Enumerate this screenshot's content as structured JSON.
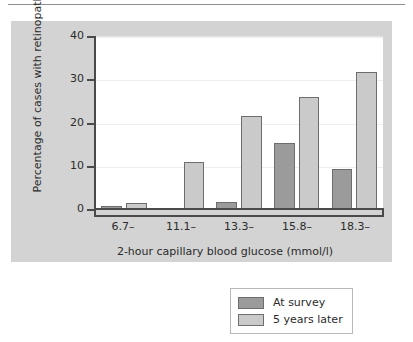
{
  "chart_data": {
    "type": "bar",
    "title": "",
    "subtitle": "",
    "xlabel": "2-hour capillary blood glucose (mmol/l)",
    "ylabel": "Percentage of cases with retinopathy",
    "categories": [
      "6.7–",
      "11.1–",
      "13.3–",
      "15.8–",
      "18.3–"
    ],
    "series": [
      {
        "name": "At survey",
        "color": "#9b9b9b",
        "values": [
          0.6,
          0,
          1.6,
          15.2,
          9.2
        ]
      },
      {
        "name": "5 years later",
        "color": "#cacaca",
        "values": [
          1.5,
          10.8,
          21.6,
          26.0,
          31.6
        ]
      }
    ],
    "ylim": [
      0,
      40
    ],
    "yticks": [
      0,
      10,
      20,
      30,
      40
    ],
    "ytick_labels": [
      "0",
      "10",
      "20",
      "30",
      "40"
    ],
    "grid": true,
    "legend_position": "bottom-right"
  },
  "legend": {
    "entries": [
      {
        "label": "At survey"
      },
      {
        "label": "5 years later"
      }
    ]
  },
  "colors": {
    "panel_background": "#d3d3d3",
    "plot_background": "#ffffff",
    "axis": "#4a4a4a",
    "bar_outline": "#6d6d6d",
    "series_at_survey": "#9b9b9b",
    "series_5_years_later": "#cacaca",
    "text": "#2b2b2b"
  }
}
